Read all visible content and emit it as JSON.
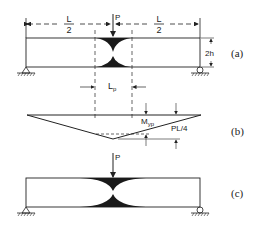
{
  "figure": {
    "panels": [
      {
        "id": "a",
        "label": "(a)",
        "description": "Simply supported beam with central point load, plastic zone at midspan",
        "load_label": "P",
        "span_left_num": "L",
        "span_left_den": "2",
        "span_right_num": "L",
        "span_right_den": "2",
        "depth_label": "2h",
        "plastic_length_label": "Lp",
        "plastic_length_main": "L",
        "plastic_length_sub": "p"
      },
      {
        "id": "b",
        "label": "(b)",
        "description": "Bending moment diagram",
        "yield_moment_main": "M",
        "yield_moment_sub": "yp",
        "max_moment_label": "PL/4"
      },
      {
        "id": "c",
        "label": "(c)",
        "description": "Beam with spread plastic zone",
        "load_label": "P"
      }
    ]
  },
  "colors": {
    "line": "#222222",
    "fill": "#1a1a1a"
  }
}
